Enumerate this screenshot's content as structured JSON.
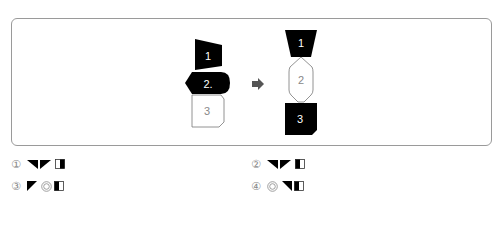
{
  "diagram": {
    "left_shapes": [
      {
        "label": "1",
        "fill": "#000000",
        "text_color": "#ffffff"
      },
      {
        "label": "2.",
        "fill": "#000000",
        "text_color": "#ffffff"
      },
      {
        "label": "3",
        "fill": "#ffffff",
        "text_color": "#888888"
      }
    ],
    "arrow": "right-arrow",
    "right_shapes": [
      {
        "label": "1",
        "fill": "#000000",
        "text_color": "#ffffff"
      },
      {
        "label": "2",
        "fill": "#ffffff",
        "text_color": "#888888"
      },
      {
        "label": "3",
        "fill": "#000000",
        "text_color": "#ffffff"
      }
    ]
  },
  "options": [
    {
      "number": "①",
      "symbols": [
        "triangle-top-right-black",
        "triangle-top-left-black",
        "rect-left-white-right-black"
      ]
    },
    {
      "number": "②",
      "symbols": [
        "triangle-top-right-black",
        "triangle-top-left-black",
        "rect-left-black-right-white"
      ]
    },
    {
      "number": "③",
      "symbols": [
        "triangle-top-left-black",
        "double-circle",
        "rect-left-black-right-white"
      ]
    },
    {
      "number": "④",
      "symbols": [
        "double-circle",
        "triangle-top-right-black",
        "rect-left-black-right-white"
      ]
    }
  ]
}
